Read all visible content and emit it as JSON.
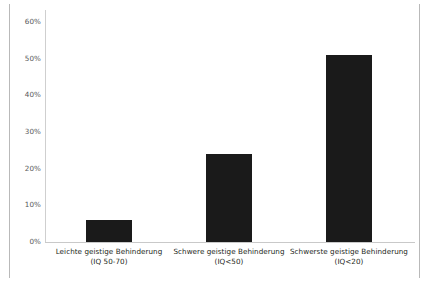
{
  "chart_data": {
    "type": "bar",
    "title": "",
    "subtitle": "",
    "xlabel": "",
    "ylabel": "",
    "ylim": [
      0,
      60
    ],
    "ytick_step": 10,
    "grid": false,
    "legend": null,
    "bar_color": "#1a1a1a",
    "axis_color": "#c9c9c9",
    "tick_text_color": "#58595b",
    "label_text_color": "#231f20",
    "ytick_labels": [
      "60%",
      "50%",
      "40%",
      "30%",
      "20%",
      "10%",
      "0%"
    ],
    "ytick_values": [
      60,
      50,
      40,
      30,
      20,
      10,
      0
    ],
    "categories": [
      "Leichte geistige Behinderung",
      "Schwere geistige Behinderung",
      "Schwerste geistige Behinderung"
    ],
    "category_sublabels": [
      "(IQ 50-70)",
      "(IQ<50)",
      "(IQ<20)"
    ],
    "values": [
      6,
      24,
      51
    ],
    "value_labels": [
      "6%",
      "24%",
      "51%"
    ]
  },
  "frame": {
    "left_rule": "vertical-rule",
    "right_rule": "vertical-rule"
  }
}
